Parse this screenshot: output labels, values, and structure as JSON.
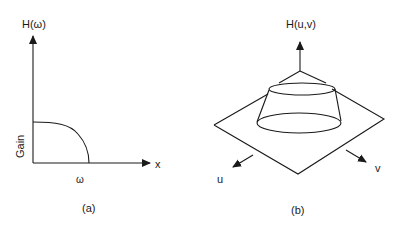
{
  "panel_a": {
    "y_axis_label": "H(ω)",
    "x_axis_label": "x",
    "gain_label": "Gain",
    "omega_label": "ω",
    "caption": "(a)"
  },
  "panel_b": {
    "z_axis_label": "H(u,v)",
    "u_label": "u",
    "v_label": "v",
    "caption": "(b)"
  },
  "colors": {
    "stroke": "#1a1a1a",
    "background": "#ffffff"
  }
}
